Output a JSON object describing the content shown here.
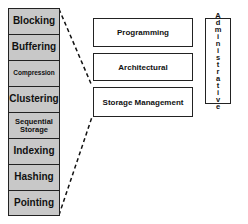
{
  "stack": {
    "items": [
      {
        "label": "Blocking",
        "height": 26,
        "size": 10
      },
      {
        "label": "Buffering",
        "height": 26,
        "size": 10
      },
      {
        "label": "Compression",
        "height": 26,
        "size": 6.5
      },
      {
        "label": "Clustering",
        "height": 26,
        "size": 10
      },
      {
        "label": "Sequential Storage",
        "height": 26,
        "size": 7.5
      },
      {
        "label": "Indexing",
        "height": 26,
        "size": 10
      },
      {
        "label": "Hashing",
        "height": 26,
        "size": 10
      },
      {
        "label": "Pointing",
        "height": 24,
        "size": 10
      }
    ]
  },
  "layers": {
    "programming": "Programming",
    "architectural": "Architectural",
    "storage_management": "Storage Management"
  },
  "side_panel": {
    "label": "Administrative"
  },
  "colors": {
    "border": "#222222",
    "stack_fill": "#c8c8c8",
    "background": "#ffffff"
  }
}
